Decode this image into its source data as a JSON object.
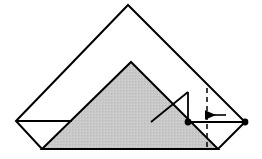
{
  "figure": {
    "type": "geometric-fold-diagram",
    "canvas": {
      "width": 262,
      "height": 159
    },
    "colors": {
      "background": "#ffffff",
      "stroke": "#000000",
      "shaded_fill": "#c4c4c4",
      "shaded_fill_light": "#cfcfcf",
      "dot_fill": "#000000"
    },
    "stroke_widths": {
      "outline": 2.0,
      "crease": 1.8,
      "dimension": 1.9,
      "arrow": 1.6,
      "dashed": 1.5
    },
    "points": {
      "apex": {
        "x": 128,
        "y": 5,
        "label": "top-apex"
      },
      "left_vertex": {
        "x": 16,
        "y": 121,
        "label": "left-vertex"
      },
      "right_vertex": {
        "x": 245,
        "y": 122,
        "label": "right-vertex"
      },
      "bottom_left": {
        "x": 42,
        "y": 149,
        "label": "bottom-left-corner"
      },
      "bottom_right": {
        "x": 218,
        "y": 149,
        "label": "bottom-right-corner"
      },
      "shaded_apex": {
        "x": 131,
        "y": 62,
        "label": "shaded-triangle-apex"
      },
      "crease_junction": {
        "x": 188,
        "y": 92,
        "label": "crease-junction"
      },
      "crease_foot": {
        "x": 151,
        "y": 122,
        "label": "crease-foot"
      },
      "horizontal_crease_end": {
        "x": 72,
        "y": 121,
        "label": "left-horizontal-crease-end"
      },
      "dimension_dot_left": {
        "x": 188,
        "y": 122,
        "label": "dimension-left-endpoint"
      },
      "dimension_dot_right": {
        "x": 245,
        "y": 122,
        "label": "dimension-right-endpoint"
      }
    },
    "shaded_triangle": {
      "name": "shaded-triangle",
      "vertices": [
        [
          42,
          149
        ],
        [
          131,
          62
        ],
        [
          218,
          149
        ]
      ]
    },
    "outline_polygon": {
      "name": "folded-square-outline",
      "vertices": [
        [
          16,
          121
        ],
        [
          128,
          5
        ],
        [
          245,
          122
        ],
        [
          218,
          149
        ],
        [
          42,
          149
        ]
      ]
    },
    "creases": [
      {
        "name": "left-horizontal-crease",
        "from": [
          16,
          121
        ],
        "to": [
          72,
          121
        ]
      },
      {
        "name": "upper-right-crease",
        "from": [
          188,
          92
        ],
        "to": [
          151,
          122
        ]
      },
      {
        "name": "vertical-crease-stub",
        "from": [
          188,
          92
        ],
        "to": [
          188,
          122
        ]
      }
    ],
    "dashed_line": {
      "name": "dashed-reference-line",
      "x": 207,
      "y_top": 88,
      "y_bottom": 149,
      "dash_pattern": "5,4"
    },
    "dimension_line": {
      "name": "dimension-line",
      "from": [
        188,
        122
      ],
      "to": [
        245,
        122
      ],
      "dot_radius": 3.4
    },
    "arrow": {
      "name": "left-pointing-arrow",
      "from": [
        226,
        115
      ],
      "to": [
        205,
        115
      ],
      "direction": "left",
      "head_length": 7,
      "head_width": 5
    },
    "labels": {
      "caption": "",
      "dimension_label": "",
      "annotation": ""
    }
  }
}
